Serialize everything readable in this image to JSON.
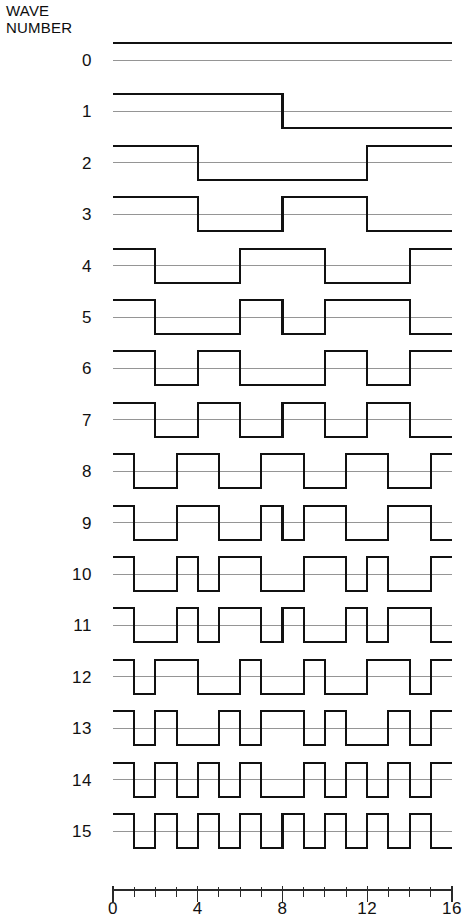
{
  "figure": {
    "header_label": "WAVE\nNUMBER",
    "background_color": "#ffffff",
    "wave_line_color": "#111111",
    "zero_line_color": "#8a8a8a",
    "axis_color": "#2a2a2a"
  },
  "plot": {
    "x_left_px": 113,
    "x_right_px": 452,
    "first_row_center_y_px": 60,
    "row_spacing_px": 51.4,
    "amplitude_px": 17,
    "wave_stroke_width": 2.1,
    "zero_stroke_width": 0.9
  },
  "labels": {
    "wave_numbers": [
      "0",
      "1",
      "2",
      "3",
      "4",
      "5",
      "6",
      "7",
      "8",
      "9",
      "10",
      "11",
      "12",
      "13",
      "14",
      "15"
    ]
  },
  "axis": {
    "x_min": 0,
    "x_max": 16,
    "minor_tick_count": 17,
    "major_tick_values": [
      0,
      4,
      8,
      12,
      16
    ],
    "major_tick_labels": [
      "0",
      "4",
      "8",
      "12",
      "16"
    ],
    "minor_tick_height_px": 7,
    "major_tick_height_px": 12,
    "axis_y_px": 890
  },
  "chart_data": {
    "type": "line",
    "xlabel": "",
    "ylabel": "WAVE NUMBER",
    "xlim": [
      0,
      16
    ],
    "ylim": [
      -1,
      1
    ],
    "grid": false,
    "legend": null,
    "x_tick_values": [
      0,
      1,
      2,
      3,
      4,
      5,
      6,
      7,
      8,
      9,
      10,
      11,
      12,
      13,
      14,
      15,
      16
    ],
    "x_major_tick_labels": {
      "0": "0",
      "4": "4",
      "8": "8",
      "12": "12",
      "16": "16"
    },
    "note": "Each series is a square wave over x in [0,16] sampled on 16 unit intervals; value +1 = high, -1 = low. Index i of values[] covers x in [i, i+1).",
    "series": [
      {
        "name": "0",
        "sequency": 0,
        "values": [
          1,
          1,
          1,
          1,
          1,
          1,
          1,
          1,
          1,
          1,
          1,
          1,
          1,
          1,
          1,
          1
        ]
      },
      {
        "name": "1",
        "sequency": 1,
        "values": [
          1,
          1,
          1,
          1,
          1,
          1,
          1,
          1,
          -1,
          -1,
          -1,
          -1,
          -1,
          -1,
          -1,
          -1
        ]
      },
      {
        "name": "2",
        "sequency": 2,
        "values": [
          1,
          1,
          1,
          1,
          -1,
          -1,
          -1,
          -1,
          -1,
          -1,
          -1,
          -1,
          1,
          1,
          1,
          1
        ]
      },
      {
        "name": "3",
        "sequency": 3,
        "values": [
          1,
          1,
          1,
          1,
          -1,
          -1,
          -1,
          -1,
          1,
          1,
          1,
          1,
          -1,
          -1,
          -1,
          -1
        ]
      },
      {
        "name": "4",
        "sequency": 4,
        "values": [
          1,
          1,
          -1,
          -1,
          -1,
          -1,
          1,
          1,
          1,
          1,
          -1,
          -1,
          -1,
          -1,
          1,
          1
        ]
      },
      {
        "name": "5",
        "sequency": 5,
        "values": [
          1,
          1,
          -1,
          -1,
          -1,
          -1,
          1,
          1,
          -1,
          -1,
          1,
          1,
          1,
          1,
          -1,
          -1
        ]
      },
      {
        "name": "6",
        "sequency": 6,
        "values": [
          1,
          1,
          -1,
          -1,
          1,
          1,
          -1,
          -1,
          -1,
          -1,
          1,
          1,
          -1,
          -1,
          1,
          1
        ]
      },
      {
        "name": "7",
        "sequency": 7,
        "values": [
          1,
          1,
          -1,
          -1,
          1,
          1,
          -1,
          -1,
          1,
          1,
          -1,
          -1,
          1,
          1,
          -1,
          -1
        ]
      },
      {
        "name": "8",
        "sequency": 8,
        "values": [
          1,
          -1,
          -1,
          1,
          1,
          -1,
          -1,
          1,
          1,
          -1,
          -1,
          1,
          1,
          -1,
          -1,
          1
        ]
      },
      {
        "name": "9",
        "sequency": 9,
        "values": [
          1,
          -1,
          -1,
          1,
          1,
          -1,
          -1,
          1,
          -1,
          1,
          1,
          -1,
          -1,
          1,
          1,
          -1
        ]
      },
      {
        "name": "10",
        "sequency": 10,
        "values": [
          1,
          -1,
          -1,
          1,
          -1,
          1,
          1,
          -1,
          -1,
          1,
          1,
          -1,
          1,
          -1,
          -1,
          1
        ]
      },
      {
        "name": "11",
        "sequency": 11,
        "values": [
          1,
          -1,
          -1,
          1,
          -1,
          1,
          1,
          -1,
          1,
          -1,
          -1,
          1,
          -1,
          1,
          1,
          -1
        ]
      },
      {
        "name": "12",
        "sequency": 12,
        "values": [
          1,
          -1,
          1,
          1,
          -1,
          -1,
          1,
          -1,
          -1,
          1,
          -1,
          -1,
          1,
          1,
          -1,
          1
        ]
      },
      {
        "name": "13",
        "sequency": 13,
        "values": [
          1,
          -1,
          1,
          -1,
          -1,
          1,
          -1,
          1,
          1,
          -1,
          1,
          -1,
          -1,
          1,
          -1,
          1
        ]
      },
      {
        "name": "14",
        "sequency": 14,
        "values": [
          1,
          -1,
          1,
          -1,
          1,
          -1,
          1,
          -1,
          -1,
          1,
          -1,
          1,
          -1,
          1,
          -1,
          1
        ]
      },
      {
        "name": "15",
        "sequency": 15,
        "values": [
          1,
          -1,
          1,
          -1,
          1,
          -1,
          1,
          -1,
          1,
          -1,
          1,
          -1,
          1,
          -1,
          1,
          -1
        ]
      }
    ]
  }
}
